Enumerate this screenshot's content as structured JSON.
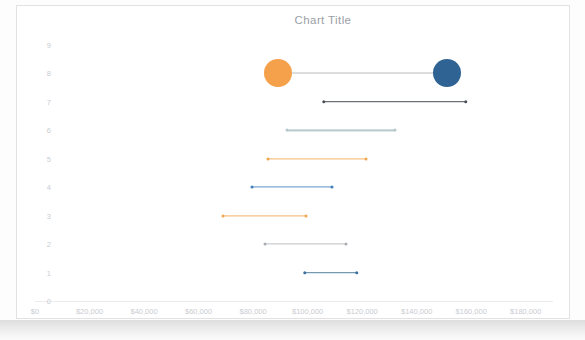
{
  "chart": {
    "title": "Chart Title"
  },
  "chart_data": {
    "type": "bar",
    "subtype": "dumbbell-range-chart",
    "title": "Chart Title",
    "xlabel": "",
    "ylabel": "",
    "grid": false,
    "legend": "none",
    "xlim": [
      0,
      190000
    ],
    "ylim": [
      0,
      9
    ],
    "x_tick_labels": [
      "$0",
      "$20,000",
      "$40,000",
      "$60,000",
      "$80,000",
      "$100,000",
      "$120,000",
      "$140,000",
      "$160,000",
      "$180,000"
    ],
    "x_tick_values": [
      0,
      20000,
      40000,
      60000,
      80000,
      100000,
      120000,
      140000,
      160000,
      180000
    ],
    "y_tick_labels": [
      "0",
      "1",
      "2",
      "3",
      "4",
      "5",
      "6",
      "7",
      "8",
      "9"
    ],
    "y_tick_values": [
      0,
      1,
      2,
      3,
      4,
      5,
      6,
      7,
      8,
      9
    ],
    "series": [
      {
        "name": "Row 8",
        "category": 8,
        "start": 89000,
        "end": 151000,
        "color": "#f5a04a",
        "end_color": "#2e6393",
        "line_color": "#b9bcc0",
        "marker": "bubble",
        "marker_size": 28
      },
      {
        "name": "Row 7",
        "category": 7,
        "start": 106000,
        "end": 158000,
        "color": "#4a4f57",
        "end_color": "#4a4f57",
        "line_color": "#4a4f57",
        "marker": "dot",
        "marker_size": 3.5
      },
      {
        "name": "Row 6",
        "category": 6,
        "start": 92500,
        "end": 132000,
        "color": "#b6c8cc",
        "end_color": "#b6c8cc",
        "line_color": "#b6c8cc",
        "marker": "dot",
        "marker_size": 3
      },
      {
        "name": "Row 5",
        "category": 5,
        "start": 85500,
        "end": 121500,
        "color": "#f0a64e",
        "end_color": "#f0a64e",
        "line_color": "#f2b267",
        "marker": "dot",
        "marker_size": 3
      },
      {
        "name": "Row 4",
        "category": 4,
        "start": 79500,
        "end": 109000,
        "color": "#3f7fb5",
        "end_color": "#3f7fb5",
        "line_color": "#5c94c4",
        "marker": "dot",
        "marker_size": 3
      },
      {
        "name": "Row 3",
        "category": 3,
        "start": 69000,
        "end": 99500,
        "color": "#f0a64e",
        "end_color": "#f0a64e",
        "line_color": "#f2b267",
        "marker": "dot",
        "marker_size": 3
      },
      {
        "name": "Row 2",
        "category": 2,
        "start": 84500,
        "end": 114000,
        "color": "#a9acb1",
        "end_color": "#a9acb1",
        "line_color": "#bcbfc3",
        "marker": "dot",
        "marker_size": 3
      },
      {
        "name": "Row 1",
        "category": 1,
        "start": 99000,
        "end": 118000,
        "color": "#3a6f9e",
        "end_color": "#3a6f9e",
        "line_color": "#53809f",
        "marker": "dot",
        "marker_size": 3.5
      }
    ]
  },
  "colors": {
    "accent_orange": "#f0a64e",
    "accent_blue": "#2e6393",
    "axis_text": "#c9ccd1",
    "title_text": "#9aa0a6",
    "card_border": "#e2e2e2"
  }
}
